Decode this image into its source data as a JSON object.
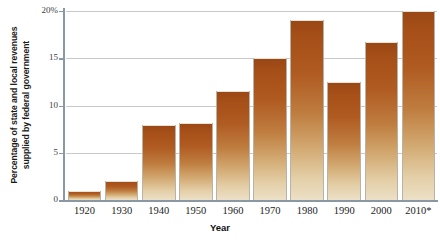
{
  "chart_data": {
    "type": "bar",
    "title": "",
    "xlabel": "Year",
    "ylabel_line1": "Percentage of state and local revenues",
    "ylabel_line2": "supplied by federal government",
    "ylabel": "Percentage of state and local revenues supplied by federal government",
    "categories": [
      "1920",
      "1930",
      "1940",
      "1950",
      "1960",
      "1970",
      "1980",
      "1990",
      "2000",
      "2010*"
    ],
    "values": [
      1.0,
      2.0,
      7.9,
      8.1,
      11.5,
      15.0,
      19.0,
      12.5,
      16.7,
      20.0
    ],
    "ylim": [
      0,
      20
    ],
    "yticks": [
      0,
      5,
      10,
      15,
      20
    ],
    "ytick_labels": [
      "0",
      "5",
      "10",
      "15",
      "20%"
    ],
    "grid": true,
    "legend": "none",
    "bar_color_top": "#9a4715",
    "bar_color_bottom": "#ece0c6",
    "axis_color": "#8a97a5",
    "gridline_color": "#c9c9cb"
  }
}
